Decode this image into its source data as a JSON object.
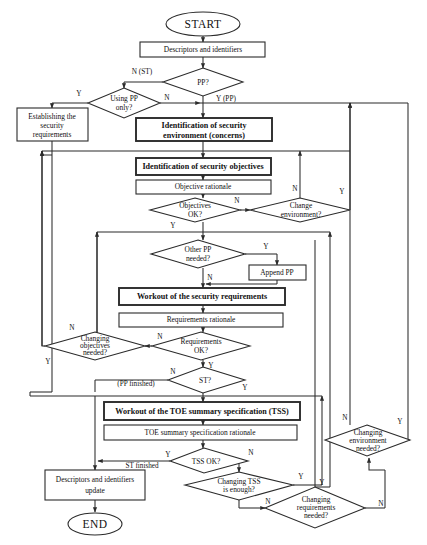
{
  "diagram": {
    "terminators": [
      {
        "id": "start",
        "label": "START"
      },
      {
        "id": "end",
        "label": "END"
      }
    ],
    "processes": [
      {
        "id": "descriptors",
        "label": "Descriptors and identifiers",
        "bold": false
      },
      {
        "id": "establishing",
        "label": "Establishing the\nsecurity\nrequirements",
        "bold": false
      },
      {
        "id": "ident-env",
        "label": "Identification of security\nenvironment (concerns)",
        "bold": true
      },
      {
        "id": "ident-obj",
        "label": "Identification of security objectives",
        "bold": true
      },
      {
        "id": "obj-rationale",
        "label": "Objective rationale",
        "bold": false
      },
      {
        "id": "append-pp",
        "label": "Append PP",
        "bold": false
      },
      {
        "id": "workout-req",
        "label": "Workout of the security requirements",
        "bold": true
      },
      {
        "id": "req-rationale",
        "label": "Requirements rationale",
        "bold": false
      },
      {
        "id": "workout-tss",
        "label": "Workout of the TOE  summary specification (TSS)",
        "bold": true
      },
      {
        "id": "tss-rationale",
        "label": "TOE summary specification  rationale",
        "bold": false
      },
      {
        "id": "descriptors-update",
        "label": "Descriptors and identifiers\nupdate",
        "bold": false
      }
    ],
    "decisions": [
      {
        "id": "pp",
        "label": "PP?"
      },
      {
        "id": "using-pp-only",
        "label": "Using PP\nonly?"
      },
      {
        "id": "objectives-ok",
        "label": "Objectives\nOK?"
      },
      {
        "id": "change-env",
        "label": "Change\nenvironment?"
      },
      {
        "id": "other-pp",
        "label": "Other PP\nneeded?"
      },
      {
        "id": "changing-obj",
        "label": "Changing\nobjectives\nneeded?"
      },
      {
        "id": "requirements-ok",
        "label": "Requirements\nOK?"
      },
      {
        "id": "st",
        "label": "ST?"
      },
      {
        "id": "tss-ok",
        "label": "TSS OK?"
      },
      {
        "id": "changing-tss",
        "label": "Changing TSS\nis enough?"
      },
      {
        "id": "changing-req",
        "label": "Changing\nrequirements\nneeded?"
      },
      {
        "id": "changing-env-needed",
        "label": "Changing\nenvironment\nneeded?"
      }
    ],
    "edge_labels": [
      {
        "id": "pp-no",
        "text": "N  (ST)"
      },
      {
        "id": "pp-yes",
        "text": "Y (PP)"
      },
      {
        "id": "usingpp-yes",
        "text": "Y"
      },
      {
        "id": "usingpp-no",
        "text": "N"
      },
      {
        "id": "objok-no",
        "text": "N"
      },
      {
        "id": "objok-yes",
        "text": "Y"
      },
      {
        "id": "changeenv-no",
        "text": "N"
      },
      {
        "id": "changeenv-yes",
        "text": "Y"
      },
      {
        "id": "otherpp-yes",
        "text": "Y"
      },
      {
        "id": "otherpp-no",
        "text": "N"
      },
      {
        "id": "changingobj-no",
        "text": "N"
      },
      {
        "id": "changingobj-yes",
        "text": "Y"
      },
      {
        "id": "reqok-no",
        "text": "N"
      },
      {
        "id": "reqok-yes",
        "text": "Y"
      },
      {
        "id": "st-no",
        "text": "N"
      },
      {
        "id": "st-no-note",
        "text": "(PP finished)"
      },
      {
        "id": "st-yes",
        "text": "Y"
      },
      {
        "id": "tssok-yes",
        "text": "Y"
      },
      {
        "id": "tssok-yes-note",
        "text": "ST finished"
      },
      {
        "id": "tssok-no",
        "text": "N"
      },
      {
        "id": "changingtss-yes",
        "text": "Y"
      },
      {
        "id": "changingtss-no",
        "text": "N"
      },
      {
        "id": "changingreq-yes",
        "text": "Y"
      },
      {
        "id": "changingreq-no",
        "text": "N"
      },
      {
        "id": "changingenvneeded-no",
        "text": "N"
      },
      {
        "id": "changingenvneeded-yes",
        "text": "Y"
      }
    ],
    "colors": {
      "stroke": "#2b2b2b",
      "fill": "#ffffff",
      "text": "#111111"
    }
  }
}
